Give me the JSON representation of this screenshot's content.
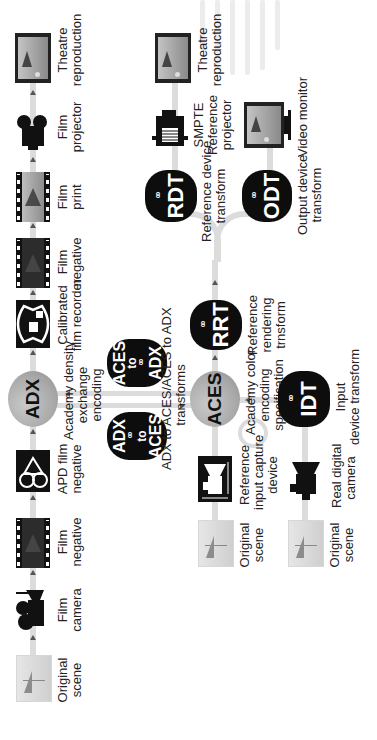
{
  "diagram": {
    "orientation": "rotated 90 degrees counter-clockwise",
    "rows": {
      "film_pipeline": [
        {
          "id": "orig-scene-1",
          "label": "Original\nscene",
          "icon": "scene-thumbnail"
        },
        {
          "id": "film-camera",
          "label": "Film\ncamera",
          "icon": "film-camera-icon"
        },
        {
          "id": "film-negative-1",
          "label": "Film\nnegative",
          "icon": "film-strip-icon"
        },
        {
          "id": "apd-film-negative",
          "label": "APD film\nnegative",
          "icon": "apd-reel-icon"
        },
        {
          "id": "adx",
          "label": "ADX",
          "caption": "Academy density\nexchange\nencoding",
          "shape": "circle"
        },
        {
          "id": "film-recorder",
          "label": "Calibrated\nfilm recorder",
          "icon": "film-recorder-icon"
        },
        {
          "id": "film-negative-2",
          "label": "Film\nnegative",
          "icon": "film-strip-icon"
        },
        {
          "id": "film-print",
          "label": "Film\nprint",
          "icon": "film-print-icon"
        },
        {
          "id": "film-projector",
          "label": "Film\nprojector",
          "icon": "film-projector-icon"
        },
        {
          "id": "theatre-1",
          "label": "Theatre\nreproduction",
          "icon": "theatre-screen-icon"
        }
      ],
      "transforms": {
        "adx_to_aces": {
          "line1": "ADX",
          "line2": "to",
          "line3": "ACES"
        },
        "aces_to_adx": {
          "line1": "ACES",
          "line2": "to",
          "line3": "ADX"
        },
        "caption": "ADX to ACES/ACES to ADX\ntransforms"
      },
      "aces_pipeline": [
        {
          "id": "orig-scene-2",
          "label": "Original\nscene"
        },
        {
          "id": "ref-input-capture",
          "label": "Reference\ninput capture\ndevice"
        },
        {
          "id": "aces",
          "label": "ACES",
          "caption": "Academy color\nencoding\nspecification"
        },
        {
          "id": "rrt",
          "label": "RRT",
          "caption": "Reference\nrendering\ntrnsform"
        },
        {
          "id": "rdt",
          "label": "RDT",
          "caption": "Reference device\ntransform"
        },
        {
          "id": "smpte-projector",
          "label": "SMPTE\nReference\nprojector"
        },
        {
          "id": "theatre-2",
          "label": "Theatre\nreproduction"
        }
      ],
      "output_branch": [
        {
          "id": "odt",
          "label": "ODT",
          "caption": "Output device\ntransform"
        },
        {
          "id": "video-monitor",
          "label": "Video monitor"
        }
      ],
      "input_branch": [
        {
          "id": "orig-scene-3",
          "label": "Original\nscene"
        },
        {
          "id": "real-digital-camera",
          "label": "Real digital\ncamera"
        },
        {
          "id": "idt",
          "label": "IDT",
          "caption": "Input\ndevice transform"
        }
      ]
    },
    "labels": {
      "orig_scene": "Original",
      "orig_scene_2": "scene",
      "film_camera_1": "Film",
      "film_camera_2": "camera",
      "film_neg_1": "Film",
      "film_neg_2": "negative",
      "apd_1": "APD film",
      "apd_2": "negative",
      "adx": "ADX",
      "adx_cap_1": "Academy density",
      "adx_cap_2": "exchange",
      "adx_cap_3": "encoding",
      "recorder_1": "Calibrated",
      "recorder_2": "film recorder",
      "print_1": "Film",
      "print_2": "print",
      "projector_1": "Film",
      "projector_2": "projector",
      "theatre_1": "Theatre",
      "theatre_2": "reproduction",
      "adx2aces_1": "ADX",
      "adx2aces_2": "to",
      "adx2aces_3": "ACES",
      "aces2adx_1": "ACES",
      "aces2adx_2": "to",
      "aces2adx_3": "ADX",
      "transforms_1": "ADX to ACES/ACES to ADX",
      "transforms_2": "transforms",
      "aces": "ACES",
      "aces_cap_1": "Academy color",
      "aces_cap_2": "encoding",
      "aces_cap_3": "specification",
      "rrt": "RRT",
      "rrt_cap_1": "Reference",
      "rrt_cap_2": "rendering",
      "rrt_cap_3": "trnsform",
      "rdt": "RDT",
      "rdt_cap_1": "Reference device",
      "rdt_cap_2": "transform",
      "smpte_1": "SMPTE",
      "smpte_2": "Reference",
      "smpte_3": "projector",
      "odt": "ODT",
      "odt_cap_1": "Output device",
      "odt_cap_2": "transform",
      "monitor": "Video monitor",
      "ref_input_1": "Reference",
      "ref_input_2": "input capture",
      "ref_input_3": "device",
      "real_cam_1": "Real digital",
      "real_cam_2": "camera",
      "idt": "IDT",
      "idt_cap_1": "Input",
      "idt_cap_2": "device transform",
      "gears": "°°"
    }
  },
  "colors": {
    "pipe": "#dcdcdc",
    "blob": "#0d0d0d",
    "circle": "#a9a9a9",
    "text": "#222222"
  }
}
